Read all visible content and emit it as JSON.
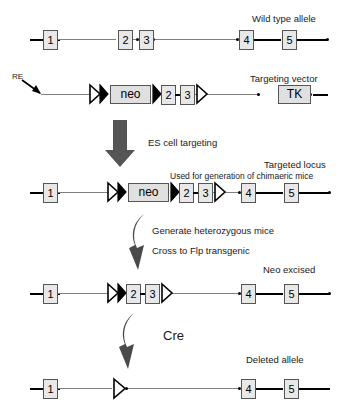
{
  "figure": {
    "type": "gene-targeting-strategy-diagram"
  },
  "rows": [
    {
      "id": "wild-type-allele",
      "label": "Wild type allele",
      "exons": [
        "1",
        "2",
        "3",
        "4",
        "5"
      ]
    },
    {
      "id": "targeting-vector",
      "label": "Targeting vector",
      "re_label": "RE",
      "cassettes": [
        "neo",
        "TK"
      ],
      "exons": [
        "2",
        "3"
      ]
    },
    {
      "id": "targeted-locus",
      "label": "Targeted locus",
      "sublabel": "Used for generation of chimaeric mice",
      "cassettes": [
        "neo"
      ],
      "exons": [
        "1",
        "2",
        "3",
        "4",
        "5"
      ]
    },
    {
      "id": "neo-excised-allele",
      "label": "Neo excised",
      "exons": [
        "1",
        "2",
        "3",
        "4",
        "5"
      ]
    },
    {
      "id": "deleted-allele",
      "label": "Deleted allele",
      "exons": [
        "1",
        "4",
        "5"
      ]
    }
  ],
  "steps": [
    {
      "id": "es-cell-targeting",
      "label": "ES cell targeting"
    },
    {
      "id": "generate-heterozygous",
      "label": "Generate heterozygous mice"
    },
    {
      "id": "cross-flp",
      "label": "Cross to Flp transgenic"
    },
    {
      "id": "cre",
      "label": "Cre"
    }
  ],
  "exon_labels": {
    "e1": "1",
    "e2": "2",
    "e3": "3",
    "e4": "4",
    "e5": "5"
  },
  "cassette_labels": {
    "neo": "neo",
    "tk": "TK"
  },
  "colors": {
    "line_thick": "#000000",
    "line_thin": "#808080",
    "box_fill": "#e8e8e8",
    "box_stroke": "#555555",
    "arrow": "#4a4a4a",
    "text": "#1a1a1a"
  }
}
